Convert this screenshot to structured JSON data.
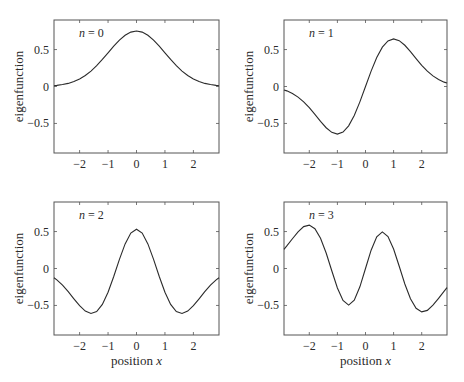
{
  "figure": {
    "ylabel": "eigenfunction",
    "xlabel_prefix": "position ",
    "xlabel_var": "x"
  },
  "chart_data": [
    {
      "type": "line",
      "panel": "top-left",
      "label_var": "n",
      "label_eq": " = ",
      "label_val": "0",
      "xlabel": "",
      "ylabel": "eigenfunction",
      "xlim": [
        -2.9,
        2.9
      ],
      "ylim": [
        -0.9,
        0.9
      ],
      "xticks": [
        -2,
        -1,
        0,
        1,
        2
      ],
      "xtick_labels": [
        "−2",
        "−1",
        "0",
        "1",
        "2"
      ],
      "yticks": [
        0.5,
        0,
        -0.5
      ],
      "ytick_labels": [
        "0.5",
        "0",
        "−0.5"
      ],
      "grid": false,
      "x": [
        -2.9,
        -2.8,
        -2.6,
        -2.4,
        -2.2,
        -2.0,
        -1.8,
        -1.6,
        -1.4,
        -1.2,
        -1.0,
        -0.8,
        -0.6,
        -0.4,
        -0.2,
        0,
        0.2,
        0.4,
        0.6,
        0.8,
        1.0,
        1.2,
        1.4,
        1.6,
        1.8,
        2.0,
        2.2,
        2.4,
        2.6,
        2.8,
        2.9
      ],
      "y": [
        0.011,
        0.015,
        0.026,
        0.042,
        0.067,
        0.102,
        0.149,
        0.209,
        0.282,
        0.366,
        0.456,
        0.545,
        0.627,
        0.693,
        0.736,
        0.751,
        0.736,
        0.693,
        0.627,
        0.545,
        0.456,
        0.366,
        0.282,
        0.209,
        0.149,
        0.102,
        0.067,
        0.042,
        0.026,
        0.015,
        0.011
      ]
    },
    {
      "type": "line",
      "panel": "top-right",
      "label_var": "n",
      "label_eq": " = ",
      "label_val": "1",
      "xlabel": "",
      "ylabel": "eigenfunction",
      "xlim": [
        -2.9,
        2.9
      ],
      "ylim": [
        -0.9,
        0.9
      ],
      "xticks": [
        -2,
        -1,
        0,
        1,
        2
      ],
      "xtick_labels": [
        "−2",
        "−1",
        "0",
        "1",
        "2"
      ],
      "yticks": [
        0.5,
        0,
        -0.5
      ],
      "ytick_labels": [
        "0.5",
        "0",
        "−0.5"
      ],
      "grid": false,
      "x": [
        -2.9,
        -2.8,
        -2.6,
        -2.4,
        -2.2,
        -2.0,
        -1.8,
        -1.6,
        -1.4,
        -1.2,
        -1.0,
        -0.8,
        -0.6,
        -0.4,
        -0.2,
        0,
        0.2,
        0.4,
        0.6,
        0.8,
        1.0,
        1.2,
        1.4,
        1.6,
        1.8,
        2.0,
        2.2,
        2.4,
        2.6,
        2.8,
        2.9
      ],
      "y": [
        -0.046,
        -0.059,
        -0.094,
        -0.143,
        -0.208,
        -0.287,
        -0.378,
        -0.472,
        -0.558,
        -0.62,
        -0.644,
        -0.617,
        -0.532,
        -0.392,
        -0.208,
        0,
        0.208,
        0.392,
        0.532,
        0.617,
        0.644,
        0.62,
        0.558,
        0.472,
        0.378,
        0.287,
        0.208,
        0.143,
        0.094,
        0.059,
        0.046
      ]
    },
    {
      "type": "line",
      "panel": "bottom-left",
      "label_var": "n",
      "label_eq": " = ",
      "label_val": "2",
      "xlabel": "position x",
      "ylabel": "eigenfunction",
      "xlim": [
        -2.9,
        2.9
      ],
      "ylim": [
        -0.9,
        0.9
      ],
      "xticks": [
        -2,
        -1,
        0,
        1,
        2
      ],
      "xtick_labels": [
        "−2",
        "−1",
        "0",
        "1",
        "2"
      ],
      "yticks": [
        0.5,
        0,
        -0.5
      ],
      "ytick_labels": [
        "0.5",
        "0",
        "−0.5"
      ],
      "grid": false,
      "x": [
        -2.9,
        -2.8,
        -2.6,
        -2.4,
        -2.2,
        -2.0,
        -1.8,
        -1.6,
        -1.4,
        -1.2,
        -1.0,
        -0.8,
        -0.6,
        -0.4,
        -0.2,
        0,
        0.2,
        0.4,
        0.6,
        0.8,
        1.0,
        1.2,
        1.4,
        1.6,
        1.8,
        2.0,
        2.2,
        2.4,
        2.6,
        2.8,
        2.9
      ],
      "y": [
        -0.125,
        -0.154,
        -0.226,
        -0.313,
        -0.41,
        -0.503,
        -0.576,
        -0.608,
        -0.582,
        -0.486,
        -0.322,
        -0.108,
        0.124,
        0.333,
        0.479,
        0.531,
        0.479,
        0.333,
        0.124,
        -0.108,
        -0.322,
        -0.486,
        -0.582,
        -0.608,
        -0.576,
        -0.503,
        -0.41,
        -0.313,
        -0.226,
        -0.154,
        -0.125
      ]
    },
    {
      "type": "line",
      "panel": "bottom-right",
      "label_var": "n",
      "label_eq": " = ",
      "label_val": "3",
      "xlabel": "position x",
      "ylabel": "eigenfunction",
      "xlim": [
        -2.9,
        2.9
      ],
      "ylim": [
        -0.9,
        0.9
      ],
      "xticks": [
        -2,
        -1,
        0,
        1,
        2
      ],
      "xtick_labels": [
        "−2",
        "−1",
        "0",
        "1",
        "2"
      ],
      "yticks": [
        0.5,
        0,
        -0.5
      ],
      "ytick_labels": [
        "0.5",
        "0",
        "−0.5"
      ],
      "grid": false,
      "x": [
        -2.9,
        -2.8,
        -2.6,
        -2.4,
        -2.2,
        -2.0,
        -1.8,
        -1.6,
        -1.4,
        -1.2,
        -1.0,
        -0.8,
        -0.6,
        -0.4,
        -0.2,
        0,
        0.2,
        0.4,
        0.6,
        0.8,
        1.0,
        1.2,
        1.4,
        1.6,
        1.8,
        2.0,
        2.2,
        2.4,
        2.6,
        2.8,
        2.9
      ],
      "y": [
        0.259,
        0.305,
        0.403,
        0.497,
        0.567,
        0.587,
        0.538,
        0.409,
        0.21,
        -0.03,
        -0.263,
        -0.433,
        -0.496,
        -0.429,
        -0.248,
        0,
        0.248,
        0.429,
        0.496,
        0.433,
        0.263,
        0.03,
        -0.21,
        -0.409,
        -0.538,
        -0.587,
        -0.567,
        -0.497,
        -0.403,
        -0.305,
        -0.259
      ]
    }
  ],
  "style": {
    "line_color": "#2b2b2b",
    "axis_color": "#555555",
    "background": "#ffffff"
  }
}
